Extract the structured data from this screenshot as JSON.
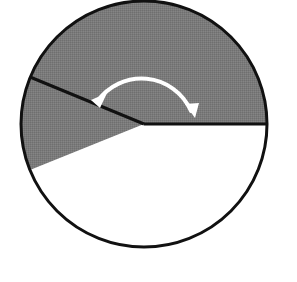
{
  "figure": {
    "kind": "geometry-diagram",
    "canvas": {
      "width": 297,
      "height": 282,
      "background": "#ffffff"
    },
    "circle": {
      "name": "circle-outline",
      "center_x": 144,
      "center_y": 124,
      "radius": 123,
      "stroke_color": "#111111",
      "stroke_width": 3,
      "fill_color": "#ffffff"
    },
    "sector": {
      "name": "shaded-sector",
      "fill_color": "#7a7a7a",
      "start_angle_deg": 0,
      "end_angle_deg": 202,
      "sweep_deg": 202,
      "vertex_x": 144,
      "vertex_y": 124,
      "radius": 123
    },
    "radii": [
      {
        "name": "radius-horizontal-right",
        "angle_deg": 0,
        "from_x": 144,
        "from_y": 124,
        "to_x": 267,
        "to_y": 124,
        "stroke_color": "#111111",
        "stroke_width": 3
      },
      {
        "name": "radius-slanted-upper-left",
        "angle_deg": 202,
        "from_x": 144,
        "from_y": 124,
        "to_x": 30,
        "to_y": 77,
        "stroke_color": "#111111",
        "stroke_width": 3
      }
    ],
    "angle_arrow": {
      "name": "angle-arc-arrow",
      "color": "#ffffff",
      "stroke_width": 4,
      "arc_radius": 54,
      "start_x": 93,
      "start_y": 98,
      "end_x": 194,
      "end_y": 116,
      "double_headed": true,
      "head_left": {
        "name": "arrowhead-left",
        "tip_x": 92,
        "tip_y": 99
      },
      "head_right": {
        "name": "arrowhead-right",
        "tip_x": 195,
        "tip_y": 117
      }
    }
  },
  "chart_data": {
    "type": "pie",
    "title": "",
    "categories": [
      "shaded sector",
      "unshaded sector"
    ],
    "values": [
      202,
      158
    ],
    "value_unit": "degrees",
    "colors": [
      "#7a7a7a",
      "#ffffff"
    ],
    "labels": [],
    "legend": "none"
  }
}
